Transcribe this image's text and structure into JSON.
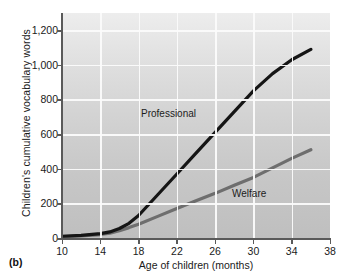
{
  "figure": {
    "panel_letter": "(b)",
    "background_color": "#d4d4d4",
    "gridline_color": "#fbfbfb",
    "axis_color": "#5a5a5a"
  },
  "chart_data": {
    "type": "line",
    "title": "",
    "xlabel": "Age of children (months)",
    "ylabel": "Children's cumulative vocabulary words",
    "xlim": [
      10,
      38
    ],
    "ylim": [
      0,
      1300
    ],
    "xticks": [
      10,
      14,
      18,
      22,
      26,
      30,
      34,
      38
    ],
    "xtick_labels": [
      "10",
      "14",
      "18",
      "22",
      "26",
      "30",
      "34",
      "38"
    ],
    "yticks": [
      0,
      200,
      400,
      600,
      800,
      1000,
      1200
    ],
    "ytick_labels": [
      "0",
      "200",
      "400",
      "600",
      "800",
      "1,000",
      "1,200"
    ],
    "grid": true,
    "legend_position": "inline-annotation",
    "series": [
      {
        "name": "Professional",
        "color": "#151515",
        "line_width": 3.2,
        "x": [
          10,
          12,
          14,
          15,
          16,
          17,
          18,
          20,
          22,
          24,
          26,
          28,
          30,
          32,
          34,
          36
        ],
        "values": [
          10,
          15,
          25,
          35,
          55,
          85,
          130,
          250,
          370,
          490,
          610,
          730,
          850,
          950,
          1030,
          1090
        ]
      },
      {
        "name": "Welfare",
        "color": "#6e6e6e",
        "line_width": 3.2,
        "x": [
          10,
          12,
          14,
          15,
          16,
          17,
          18,
          20,
          22,
          24,
          26,
          28,
          30,
          32,
          34,
          36
        ],
        "values": [
          8,
          12,
          20,
          28,
          42,
          60,
          80,
          125,
          170,
          215,
          258,
          305,
          350,
          405,
          460,
          510
        ]
      }
    ],
    "annotations": [
      {
        "text": "Professional",
        "x": 20.5,
        "y": 760
      },
      {
        "text": "Welfare",
        "x": 29.5,
        "y": 290
      }
    ]
  }
}
